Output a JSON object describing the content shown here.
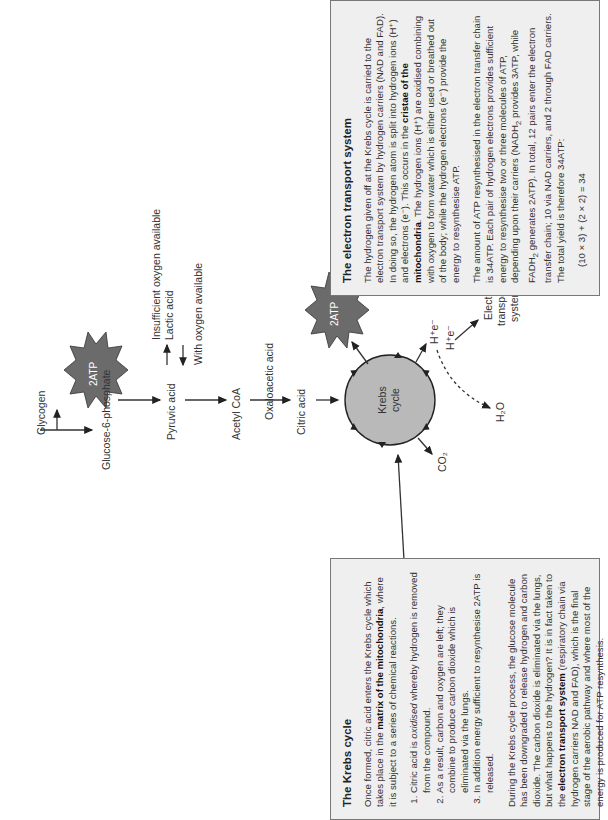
{
  "diagram": {
    "pathway": {
      "glycogen": "Glycogen",
      "glucose6p": "Glucose-6-phosphate",
      "pyruvic": "Pyruvic acid",
      "insufficient_o2": "Insufficient oxygen available",
      "lactic": "Lactic acid",
      "with_o2": "With oxygen available",
      "acetyl": "Acetyl CoA",
      "oxaloacetic": "Oxaloacetic acid",
      "citric": "Citric acid",
      "atp1": "2ATP",
      "atp2": "2ATP",
      "krebs_line1": "Krebs",
      "krebs_line2": "cycle",
      "co2": "CO₂",
      "h_e_1": "H⁺e⁻",
      "h_e_2": "H⁺e⁻",
      "h2o": "H₂O",
      "ets_line1": "Electron",
      "ets_line2": "transport",
      "ets_line3": "system"
    },
    "colors": {
      "burst_fill": "#6b6b6b",
      "circle_fill": "#b9b9b9",
      "box_fill": "#efefef",
      "box_border": "#777777"
    }
  },
  "krebs_box": {
    "title": "The Krebs cycle",
    "intro_a": "Once formed, citric acid enters the Krebs cycle which takes place in the ",
    "intro_bold": "matrix of the mitochondria",
    "intro_b": ", where it is subject to a series of chemical reactions.",
    "list": [
      {
        "pre": "Citric acid is ",
        "italic": "oxidised",
        "post": " whereby hydrogen is removed from the compound."
      },
      {
        "pre": "As a result, carbon and oxygen are left; they combine to produce carbon dioxide which is eliminated via the lungs.",
        "italic": "",
        "post": ""
      },
      {
        "pre": "In addition energy sufficient to resynthesise 2ATP is released.",
        "italic": "",
        "post": ""
      }
    ],
    "para2_a": "During the Krebs cycle process, the glucose molecule has been downgraded to release hydrogen and carbon dioxide. The carbon dioxide is eliminated via the lungs, but what happens to the hydrogen? It is in fact taken to the ",
    "para2_bold": "electron transport system",
    "para2_b": " (respiratory chain via hydrogen carriers NAD and FAD), which is the final stage of the aerobic pathway and where most of the energy is produced for ATP resynthesis."
  },
  "ets_box": {
    "title": "The electron transport system",
    "para1_a": "The hydrogen given off at the Krebs cycle is carried to the electron transport system by hydrogen carriers (NAD and FAD). In doing so, the hydrogen atom is split into hydrogen ions (H⁺) and electrons (e⁻). This occurs in the ",
    "para1_bold": "cristae of the mitochondria",
    "para1_b": ". The hydrogen ions (H⁺) are oxidised combining with oxygen to form water which is either used or breathed out of the body; while the hydrogen electrons (e⁻) provide the energy to resynthesise ATP.",
    "para2_a": "The amount of ATP resynthesised in the electron transfer chain is 34ATP. Each pair of hydrogen electrons provides sufficient energy to resynthesise two or three molecules of ATP, depending upon their carriers (NADH",
    "para2_sub1": "2",
    "para2_b": " provides 3ATP, while FADH",
    "para2_sub2": "2",
    "para2_c": " generates 2ATP). In total, 12 pairs enter the electron transfer chain; 10 via NAD carriers, and 2 through FAD carriers. The total yield is therefore 34ATP:",
    "equation": "(10 × 3) + (2 × 2) = 34"
  }
}
